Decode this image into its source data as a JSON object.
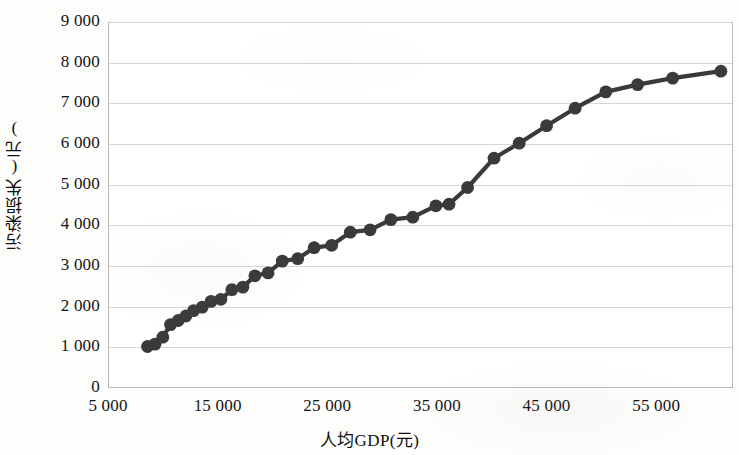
{
  "chart_data": {
    "type": "line",
    "title": "",
    "subtitle": "",
    "xlabel": "人均GDP(元)",
    "ylabel": "污染损失(元)",
    "xlim": [
      5000,
      62000
    ],
    "ylim": [
      0,
      9000
    ],
    "grid": true,
    "legend": null,
    "legend_position": "none",
    "marker": "circle",
    "series_color": "#3a3a3a",
    "xticks": [
      5000,
      15000,
      25000,
      35000,
      45000,
      55000
    ],
    "xtick_labels": [
      "5 000",
      "15 000",
      "25 000",
      "35 000",
      "45 000",
      "55 000"
    ],
    "yticks": [
      0,
      1000,
      2000,
      3000,
      4000,
      5000,
      6000,
      7000,
      8000,
      9000
    ],
    "ytick_labels": [
      "0",
      "1 000",
      "2 000",
      "3 000",
      "4 000",
      "5 000",
      "6 000",
      "7 000",
      "8 000",
      "9 000"
    ],
    "series": [
      {
        "name": "污染损失",
        "x": [
          8600,
          9300,
          10000,
          10700,
          11400,
          12100,
          12800,
          13600,
          14400,
          15300,
          16300,
          17300,
          18400,
          19600,
          20900,
          22300,
          23800,
          25400,
          27100,
          28900,
          30800,
          32800,
          34900,
          36100,
          37800,
          40200,
          42500,
          45000,
          47600,
          50400,
          53300,
          56500,
          60900
        ],
        "y": [
          1020,
          1080,
          1250,
          1560,
          1660,
          1770,
          1900,
          1990,
          2130,
          2180,
          2420,
          2480,
          2760,
          2830,
          3120,
          3180,
          3450,
          3510,
          3830,
          3890,
          4140,
          4200,
          4480,
          4520,
          4930,
          5650,
          6020,
          6450,
          6880,
          7280,
          7460,
          7620,
          7790
        ]
      }
    ]
  },
  "axes": {
    "x_title": "人均GDP(元)",
    "y_title": "污染损失(元)"
  }
}
